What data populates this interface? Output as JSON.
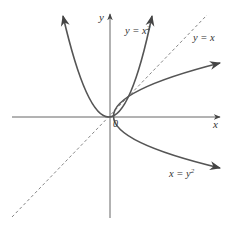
{
  "figure": {
    "type": "function-graph",
    "axes": {
      "x_label": "x",
      "y_label": "y",
      "origin_label": "0"
    },
    "curves": [
      {
        "id": "parabola-up",
        "equation_label": "y = x",
        "exponent": "2",
        "description": "y = x^2",
        "style": "solid"
      },
      {
        "id": "parabola-side",
        "equation_label": "x = y",
        "exponent": "2",
        "description": "x = y^2",
        "style": "solid"
      },
      {
        "id": "identity-line",
        "equation_label": "y = x",
        "description": "y = x",
        "style": "dashed"
      }
    ],
    "intersection_points": [
      "(0, 0)",
      "(1, 1)"
    ],
    "colors": {
      "curve": "#555555",
      "axis": "#666666",
      "dashed": "#777777",
      "text": "#333333"
    }
  }
}
